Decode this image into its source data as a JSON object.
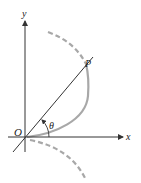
{
  "diagram": {
    "labels": {
      "y_axis": "y",
      "x_axis": "x",
      "origin": "O",
      "point": "P",
      "angle": "θ"
    },
    "colors": {
      "axis": "#333333",
      "line": "#333333",
      "curve": "#a8a8a8",
      "text": "#222222"
    }
  }
}
